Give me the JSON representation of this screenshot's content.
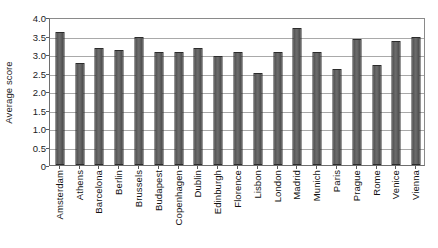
{
  "chart_data": {
    "type": "bar",
    "title": "",
    "xlabel": "",
    "ylabel": "Average score",
    "ylim": [
      0,
      4.0
    ],
    "yticks": [
      "0",
      "0.5",
      "1.0",
      "1.5",
      "2.0",
      "2.5",
      "3.0",
      "3.5",
      "4.0"
    ],
    "ytick_values": [
      0,
      0.5,
      1.0,
      1.5,
      2.0,
      2.5,
      3.0,
      3.5,
      4.0
    ],
    "grid": true,
    "legend": "none",
    "bar_color": "#5f5f5f",
    "bar_edge_color": "#2c2c2c",
    "categories": [
      "Amsterdam",
      "Athens",
      "Barcelona",
      "Berlin",
      "Brussels",
      "Budapest",
      "Copenhagen",
      "Dublin",
      "Edinburgh",
      "Florence",
      "Lisbon",
      "London",
      "Madrid",
      "Munich",
      "Paris",
      "Prague",
      "Rome",
      "Venice",
      "Vienna"
    ],
    "values": [
      3.6,
      2.75,
      3.15,
      3.1,
      3.45,
      3.05,
      3.05,
      3.15,
      2.95,
      3.05,
      2.5,
      3.05,
      3.7,
      3.05,
      2.6,
      3.4,
      2.7,
      3.35,
      3.45
    ]
  }
}
